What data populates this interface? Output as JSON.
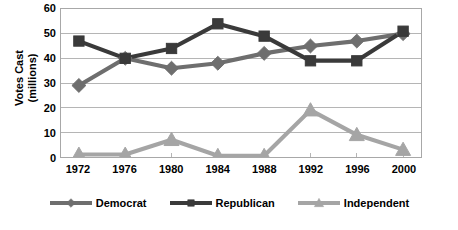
{
  "chart_data": {
    "type": "line",
    "title": "",
    "xlabel": "",
    "ylabel": "Votes Cast (millions)",
    "ylabel_lines": [
      "Votes Cast",
      "(millions)"
    ],
    "categories": [
      "1972",
      "1976",
      "1980",
      "1984",
      "1988",
      "1992",
      "1996",
      "2000"
    ],
    "ylim": [
      0,
      60
    ],
    "yticks": [
      0,
      10,
      20,
      30,
      40,
      50,
      60
    ],
    "ytick_labels": [
      "0",
      "10",
      "20",
      "30",
      "40",
      "50",
      "60"
    ],
    "grid": "horizontal",
    "legend_position": "bottom",
    "series": [
      {
        "name": "Democrat",
        "color": "#6e6e6e",
        "marker": "diamond",
        "values": [
          29,
          40,
          36,
          38,
          42,
          45,
          47,
          50
        ]
      },
      {
        "name": "Republican",
        "color": "#3a3a3a",
        "marker": "square",
        "values": [
          47,
          40,
          44,
          54,
          49,
          39,
          39,
          51
        ]
      },
      {
        "name": "Independent",
        "color": "#a5a5a5",
        "marker": "triangle",
        "values": [
          1,
          1,
          7,
          0.5,
          0.5,
          19,
          9,
          3
        ]
      }
    ]
  },
  "colors": {
    "democrat": "#6e6e6e",
    "republican": "#3a3a3a",
    "independent": "#a5a5a5",
    "grid": "#b4b4b4",
    "frame": "#a8a8a8",
    "text": "#000000",
    "background": "#ffffff"
  },
  "legend": {
    "items": [
      {
        "label": "Democrat"
      },
      {
        "label": "Republican"
      },
      {
        "label": "Independent"
      }
    ]
  }
}
